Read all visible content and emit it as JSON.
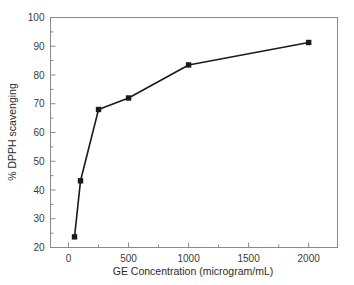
{
  "figure": {
    "background_color": "#ffffff",
    "frame_color": "#8a8a8a",
    "series_color": "#1a1a1a",
    "text_color": "#3a3a3a"
  },
  "chart_data": {
    "type": "line",
    "title": "",
    "xlabel": "GE Concentration (microgram/mL)",
    "ylabel": "% DPPH scavenging",
    "xlim": [
      -150,
      2240
    ],
    "ylim": [
      20,
      100
    ],
    "grid": false,
    "legend": null,
    "marker": "filled-square",
    "x": [
      50,
      100,
      250,
      500,
      1000,
      2000
    ],
    "y": [
      23.7,
      43.2,
      68.0,
      72.0,
      83.5,
      91.3
    ],
    "series": [
      {
        "name": "% DPPH scavenging",
        "x": [
          50,
          100,
          250,
          500,
          1000,
          2000
        ],
        "values": [
          23.7,
          43.2,
          68.0,
          72.0,
          83.5,
          91.3
        ]
      }
    ],
    "xticks": [
      0,
      500,
      1000,
      1500,
      2000
    ],
    "xtick_labels": [
      "0",
      "500",
      "1000",
      "1500",
      "2000"
    ],
    "xminor_ticks": [
      250,
      750,
      1250,
      1750
    ],
    "yticks": [
      20,
      30,
      40,
      50,
      60,
      70,
      80,
      90,
      100
    ],
    "ytick_labels": [
      "20",
      "30",
      "40",
      "50",
      "60",
      "70",
      "80",
      "90",
      "100"
    ],
    "yminor_ticks": [
      25,
      35,
      45,
      55,
      65,
      75,
      85,
      95
    ]
  }
}
